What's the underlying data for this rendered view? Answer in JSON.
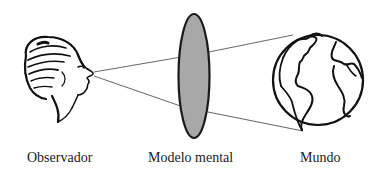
{
  "diagram": {
    "labels": {
      "observer": "Observador",
      "model": "Modelo mental",
      "world": "Mundo"
    },
    "colors": {
      "stroke": "#1a1a1a",
      "lens_fill": "#a8a8a8",
      "line": "#555555",
      "background": "#ffffff"
    },
    "icons": {
      "observer": "human-head-profile-icon",
      "model": "lens-ellipse",
      "world": "globe-icon"
    }
  }
}
